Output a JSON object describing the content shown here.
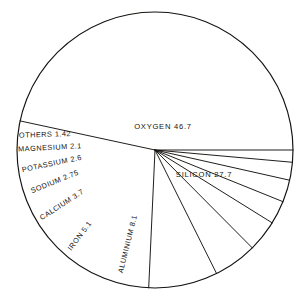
{
  "chart_data": {
    "type": "pie",
    "title": "",
    "subtitle": "",
    "xlabel": "",
    "ylabel": "",
    "legend_position": "none",
    "grid": false,
    "unit": "percent",
    "categories": [
      "OXYGEN",
      "SILICON",
      "ALUMINIUM",
      "IRON",
      "CALCIUM",
      "SODIUM",
      "POTASSIUM",
      "MAGNESIUM",
      "OTHERS"
    ],
    "values": [
      46.7,
      27.7,
      8.1,
      5.1,
      3.7,
      2.75,
      2.6,
      2.1,
      1.42
    ],
    "slices": [
      {
        "name": "OXYGEN",
        "value": 46.7,
        "label": "OXYGEN  46.7",
        "label_x": 163,
        "label_y": 127,
        "rotation": 0,
        "anchor": "middle",
        "size": "big"
      },
      {
        "name": "SILICON",
        "value": 27.7,
        "label": "SILICON  27.7",
        "label_x": 204,
        "label_y": 175,
        "rotation": 0,
        "anchor": "middle",
        "size": "big"
      },
      {
        "name": "ALUMINIUM",
        "value": 8.1,
        "label": "ALUMINIUM  8.1",
        "label_x": 128,
        "label_y": 244,
        "rotation": -76,
        "anchor": "middle",
        "size": "small"
      },
      {
        "name": "IRON",
        "value": 5.1,
        "label": "IRON  5.1",
        "label_x": 80,
        "label_y": 236,
        "rotation": -53,
        "anchor": "middle",
        "size": "small"
      },
      {
        "name": "CALCIUM",
        "value": 3.7,
        "label": "CALCIUM  3.7",
        "label_x": 62,
        "label_y": 205,
        "rotation": -33,
        "anchor": "middle",
        "size": "small"
      },
      {
        "name": "SODIUM",
        "value": 2.75,
        "label": "SODIUM  2.75",
        "label_x": 55,
        "label_y": 182,
        "rotation": -22,
        "anchor": "middle",
        "size": "small"
      },
      {
        "name": "POTASSIUM",
        "value": 2.6,
        "label": "POTASSIUM  2.6",
        "label_x": 52,
        "label_y": 164,
        "rotation": -12,
        "anchor": "middle",
        "size": "small"
      },
      {
        "name": "MAGNESIUM",
        "value": 2.1,
        "label": "MAGNESIUM  2.1",
        "label_x": 50,
        "label_y": 148,
        "rotation": -3,
        "anchor": "middle",
        "size": "small"
      },
      {
        "name": "OTHERS",
        "value": 1.42,
        "label": "OTHERS  1.42",
        "label_x": 45,
        "label_y": 135,
        "rotation": -2,
        "anchor": "middle",
        "size": "small"
      }
    ],
    "geometry": {
      "center_x": 155,
      "center_y": 150,
      "radius": 138
    },
    "colors": {
      "stroke": "#15120f",
      "fill": "#ffffff",
      "text": "#15120f"
    }
  }
}
